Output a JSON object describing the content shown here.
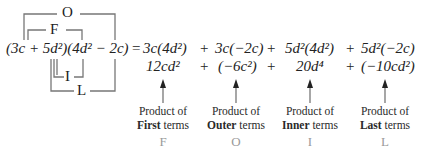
{
  "brackets": {
    "outer": "O",
    "first": "F",
    "inner": "I",
    "last": "L"
  },
  "expression": {
    "left": "(3c + 5d²)(4d² − 2c)",
    "equals": "="
  },
  "row1": {
    "terms": [
      "3c(4d²)",
      "3c(−2c)",
      "5d²(4d²)",
      "5d²(−2c)"
    ],
    "operator": "+"
  },
  "row2": {
    "terms": [
      "12cd²",
      "(−6c²)",
      "20d⁴",
      "(−10cd²)"
    ],
    "operator": "+"
  },
  "labels": [
    {
      "line1": "Product of",
      "bold": "First",
      "rest": " terms",
      "letter": "F"
    },
    {
      "line1": "Product of",
      "bold": "Outer",
      "rest": " terms",
      "letter": "O"
    },
    {
      "line1": "Product of",
      "bold": "Inner",
      "rest": " terms",
      "letter": "I"
    },
    {
      "line1": "Product of",
      "bold": "Last",
      "rest": " terms",
      "letter": "L"
    }
  ],
  "colors": {
    "text": "#222222",
    "lines": "#777777",
    "foil_letters": "#9a9a9a"
  }
}
